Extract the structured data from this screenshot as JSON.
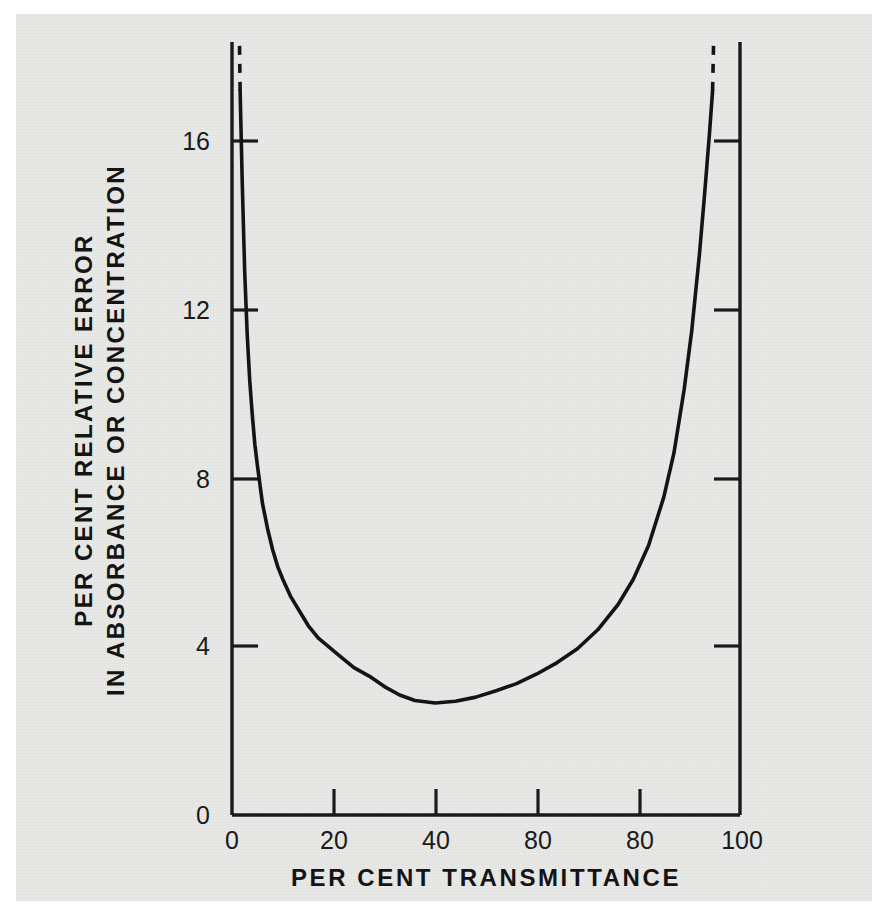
{
  "figure": {
    "background_color": "#e8e8e6",
    "ink_color": "#1a1a1a"
  },
  "axis_titles": {
    "x": "PER CENT  TRANSMITTANCE",
    "y_line1": "PER CENT RELATIVE ERROR",
    "y_line2": "IN ABSORBANCE OR CONCENTRATION"
  },
  "x_ticks": [
    {
      "label": "0",
      "value": 0
    },
    {
      "label": "20",
      "value": 20
    },
    {
      "label": "40",
      "value": 40
    },
    {
      "label": "80",
      "value": 60
    },
    {
      "label": "80",
      "value": 80
    },
    {
      "label": "100",
      "value": 100
    }
  ],
  "y_ticks": [
    {
      "label": "0",
      "value": 0
    },
    {
      "label": "4",
      "value": 4
    },
    {
      "label": "8",
      "value": 8
    },
    {
      "label": "12",
      "value": 12
    },
    {
      "label": "16",
      "value": 16
    }
  ],
  "chart_data": {
    "type": "line",
    "title": "",
    "xlabel": "PER CENT  TRANSMITTANCE",
    "ylabel": "PER CENT RELATIVE ERROR IN ABSORBANCE OR CONCENTRATION",
    "xlim": [
      0,
      100
    ],
    "ylim": [
      0,
      17.8
    ],
    "grid": false,
    "legend": "none",
    "x_tick_values": [
      0,
      20,
      40,
      60,
      80,
      100
    ],
    "y_tick_values": [
      0,
      4,
      8,
      12,
      16
    ],
    "minimum": {
      "x": 36.0,
      "y": 2.65
    },
    "series": [
      {
        "name": "Per cent relative error",
        "style": "solid",
        "x": [
          1.6,
          2.0,
          2.5,
          3.0,
          3.5,
          4.0,
          4.5,
          5.0,
          6.0,
          7.0,
          8.0,
          9.0,
          10.0,
          11.5,
          13.0,
          15.0,
          17.0,
          19.0,
          21.0,
          24.0,
          27.0,
          30.0,
          33.0,
          36.0,
          40.0,
          44.0,
          48.0,
          52.0,
          56.0,
          60.0,
          64.0,
          68.0,
          72.0,
          76.0,
          79.0,
          82.0,
          85.0,
          87.0,
          89.0,
          90.5,
          92.0,
          93.0,
          94.0,
          94.6
        ],
        "y": [
          17.2,
          15.1,
          12.9,
          11.4,
          10.3,
          9.5,
          8.8,
          8.3,
          7.4,
          6.8,
          6.3,
          5.9,
          5.6,
          5.2,
          4.9,
          4.5,
          4.2,
          4.0,
          3.8,
          3.5,
          3.3,
          3.05,
          2.85,
          2.72,
          2.66,
          2.7,
          2.8,
          2.95,
          3.12,
          3.35,
          3.62,
          3.95,
          4.4,
          5.0,
          5.6,
          6.4,
          7.55,
          8.6,
          10.1,
          11.5,
          13.3,
          14.7,
          16.2,
          17.2
        ]
      },
      {
        "name": "Left asymptote extension",
        "style": "dashed",
        "x": [
          1.6,
          1.45,
          1.3
        ],
        "y": [
          17.2,
          18.6,
          20.2
        ]
      },
      {
        "name": "Right asymptote extension",
        "style": "dashed",
        "x": [
          94.6,
          94.85,
          95.1
        ],
        "y": [
          17.2,
          18.6,
          20.2
        ]
      }
    ]
  }
}
